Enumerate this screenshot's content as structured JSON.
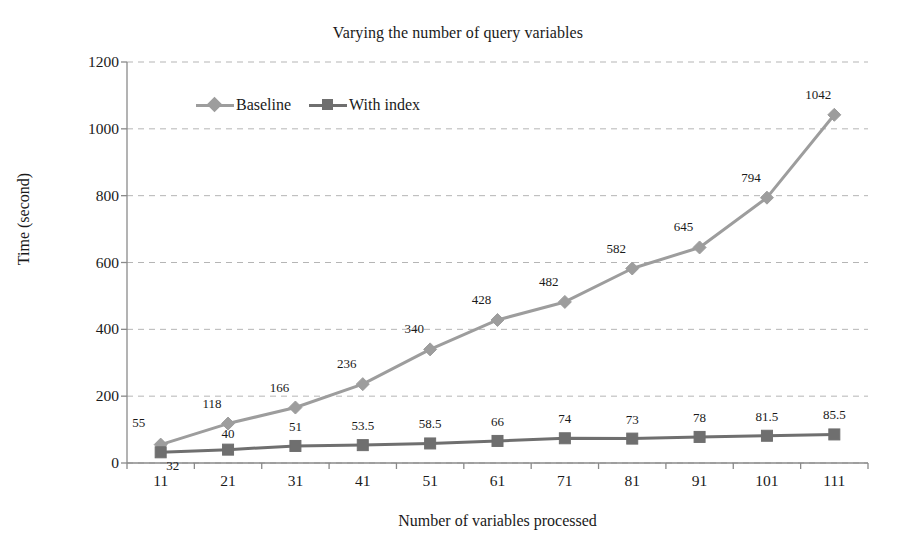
{
  "chart_data": {
    "type": "line",
    "title": "Varying the number of query variables",
    "xlabel": "Number of variables processed",
    "ylabel": "Time (second)",
    "categories": [
      11,
      21,
      31,
      41,
      51,
      61,
      71,
      81,
      91,
      101,
      111
    ],
    "x_tick_labels": [
      "11",
      "21",
      "31",
      "41",
      "51",
      "61",
      "71",
      "81",
      "91",
      "101",
      "111"
    ],
    "y_tick_labels": [
      "0",
      "200",
      "400",
      "600",
      "800",
      "1000",
      "1200"
    ],
    "y_ticks": [
      0,
      200,
      400,
      600,
      800,
      1000,
      1200
    ],
    "ylim": [
      0,
      1200
    ],
    "grid": "horizontal-dashed",
    "legend_position": "top-left-inside",
    "series": [
      {
        "name": "Baseline",
        "marker": "diamond",
        "color": "#9d9d9d",
        "values": [
          55,
          118,
          166,
          236,
          340,
          428,
          482,
          582,
          645,
          794,
          1042
        ],
        "labels": [
          "55",
          "118",
          "166",
          "236",
          "340",
          "428",
          "482",
          "582",
          "645",
          "794",
          "1042"
        ]
      },
      {
        "name": "With index",
        "marker": "square",
        "color": "#6f6f6f",
        "values": [
          32,
          40,
          51,
          53.5,
          58.5,
          66,
          74,
          73,
          78,
          81.5,
          85.5
        ],
        "labels": [
          "32",
          "40",
          "51",
          "53.5",
          "58.5",
          "66",
          "74",
          "73",
          "78",
          "81.5",
          "85.5"
        ]
      }
    ]
  },
  "legend": {
    "items": [
      {
        "label": "Baseline"
      },
      {
        "label": "With index"
      }
    ]
  },
  "colors": {
    "baseline": "#9d9d9d",
    "with_index": "#6f6f6f",
    "grid": "#b5b5b5",
    "axis": "#8a8a8a",
    "text": "#1a1a1a"
  }
}
